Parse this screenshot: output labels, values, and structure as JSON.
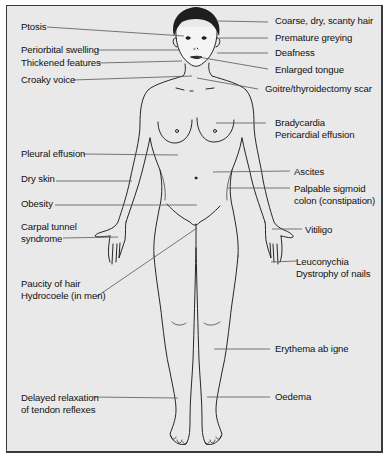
{
  "diagram": {
    "colors": {
      "background": "#e9e9e9",
      "border": "#3a3a3a",
      "line": "#555555",
      "hair": "#1e1e1e",
      "text": "#111111"
    },
    "labels_left": [
      {
        "id": "ptosis",
        "lines": [
          "Ptosis"
        ]
      },
      {
        "id": "periorbital",
        "lines": [
          "Periorbital swelling"
        ]
      },
      {
        "id": "thickened",
        "lines": [
          "Thickened features"
        ]
      },
      {
        "id": "croaky",
        "lines": [
          "Croaky voice"
        ]
      },
      {
        "id": "pleural",
        "lines": [
          "Pleural effusion"
        ]
      },
      {
        "id": "dryskin",
        "lines": [
          "Dry skin"
        ]
      },
      {
        "id": "obesity",
        "lines": [
          "Obesity"
        ]
      },
      {
        "id": "carpal",
        "lines": [
          "Carpal tunnel",
          "syndrome"
        ]
      },
      {
        "id": "paucity",
        "lines": [
          "Paucity of hair",
          "Hydrocoele (in men)"
        ]
      },
      {
        "id": "delayed",
        "lines": [
          "Delayed relaxation",
          "of tendon reflexes"
        ]
      }
    ],
    "labels_right": [
      {
        "id": "coarse",
        "lines": [
          "Coarse, dry, scanty hair"
        ]
      },
      {
        "id": "greying",
        "lines": [
          "Premature greying"
        ]
      },
      {
        "id": "deafness",
        "lines": [
          "Deafness"
        ]
      },
      {
        "id": "tongue",
        "lines": [
          "Enlarged tongue"
        ]
      },
      {
        "id": "goitre",
        "lines": [
          "Goitre/thyroidectomy scar"
        ]
      },
      {
        "id": "brady",
        "lines": [
          "Bradycardia",
          "Pericardial effusion"
        ]
      },
      {
        "id": "ascites",
        "lines": [
          "Ascites"
        ]
      },
      {
        "id": "sigmoid",
        "lines": [
          "Palpable sigmoid",
          "colon (constipation)"
        ]
      },
      {
        "id": "vitiligo",
        "lines": [
          "Vitiligo"
        ]
      },
      {
        "id": "nails",
        "lines": [
          "Leuconychia",
          "Dystrophy of nails"
        ]
      },
      {
        "id": "erythema",
        "lines": [
          "Erythema ab igne"
        ]
      },
      {
        "id": "oedema",
        "lines": [
          "Oedema"
        ]
      }
    ]
  }
}
